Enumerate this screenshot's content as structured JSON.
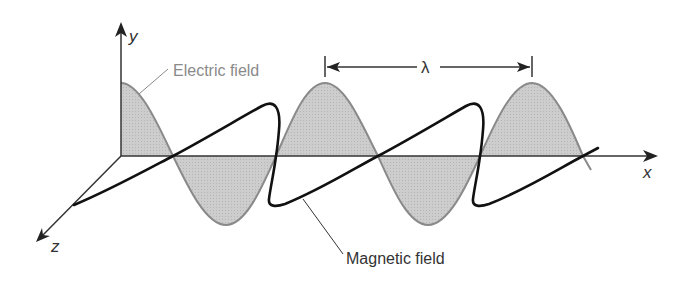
{
  "diagram": {
    "axes": {
      "x": "x",
      "y": "y",
      "z": "z"
    },
    "labels": {
      "electric": "Electric field",
      "magnetic": "Magnetic field",
      "wavelength": "λ"
    },
    "colors": {
      "electric_stroke": "#8a8a8a",
      "electric_fill": "#c8c8c8",
      "magnetic_stroke": "#111111",
      "axis": "#333333",
      "electric_label": "#8a8a8a",
      "text": "#333333"
    }
  }
}
